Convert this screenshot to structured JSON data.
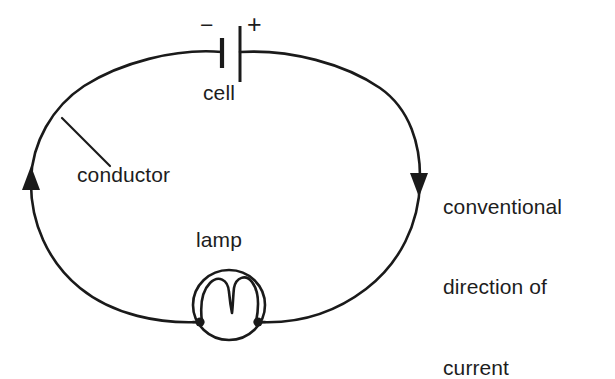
{
  "figure": {
    "title": "Simple electric circuit",
    "background_color": "#ffffff",
    "stroke_color": "#1a1a1a",
    "width": 615,
    "height": 361
  },
  "labels": {
    "cell": "cell",
    "lamp": "lamp",
    "conductor": "conductor",
    "minus_terminal": "−",
    "plus_terminal": "+",
    "current_line1": "conventional",
    "current_line2": "direction of",
    "current_line3": "current"
  },
  "components": {
    "loop": {
      "name": "conductor-loop",
      "shape": "ellipse",
      "center_x": 226,
      "center_y": 190,
      "radius_x": 196,
      "radius_y": 141
    },
    "cell": {
      "name": "cell-symbol",
      "negative_plate_x": 222,
      "positive_plate_x": 240,
      "negative_plate_height": 30,
      "positive_plate_height": 56
    },
    "lamp": {
      "name": "lamp-symbol",
      "center_x": 229,
      "center_y": 305,
      "radius_x": 36,
      "radius_y": 35,
      "terminal_left_x": 200,
      "terminal_right_x": 258,
      "terminal_y": 322
    },
    "arrows": [
      {
        "name": "current-arrow-left",
        "x": 32,
        "y": 178,
        "direction": "up"
      },
      {
        "name": "current-arrow-right",
        "x": 418,
        "y": 185,
        "direction": "down"
      }
    ],
    "leader_line": {
      "name": "conductor-leader-line",
      "from_x": 62,
      "from_y": 118,
      "to_x": 110,
      "to_y": 166
    }
  }
}
